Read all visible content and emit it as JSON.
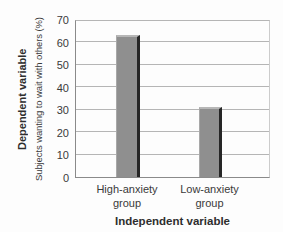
{
  "chart_data": {
    "type": "bar",
    "categories": [
      "High-anxiety\ngroup",
      "Low-anxiety\ngroup"
    ],
    "values": [
      63,
      31
    ],
    "title": "",
    "xlabel": "Independent variable",
    "ylabel": "Subjects wanting to wait with others (%)",
    "ylabel_outer": "Dependent variable",
    "ylim": [
      0,
      70
    ],
    "yticks": [
      0,
      10,
      20,
      30,
      40,
      50,
      60,
      70
    ],
    "grid": true,
    "legend": null,
    "colors": {
      "bar_body": "#8f8f8f",
      "bar_edge_dark": "#262626",
      "bar_edge_light": "#b7b7b7",
      "gridline": "#b5b5b5",
      "axis": "#8a8a8a",
      "text": "#3a3a3a"
    }
  }
}
